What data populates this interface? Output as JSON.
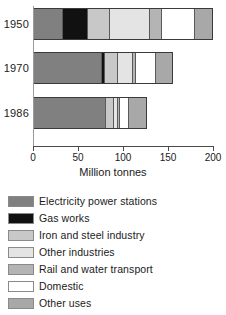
{
  "chart_data": {
    "type": "bar",
    "orientation": "horizontal",
    "stacked": true,
    "title": "",
    "xlabel": "Million tonnes",
    "ylabel": "",
    "xlim": [
      0,
      200
    ],
    "xticks": [
      0,
      50,
      100,
      150,
      200
    ],
    "xtick_labels": [
      "0",
      "50",
      "100",
      "150",
      "200"
    ],
    "grid": false,
    "legend_position": "below",
    "categories": [
      "1950",
      "1970",
      "1986"
    ],
    "series": [
      {
        "name": "Electricity power stations",
        "color": "#808080",
        "values": [
          33,
          77,
          82
        ]
      },
      {
        "name": "Gas works",
        "color": "#111111",
        "values": [
          28,
          3,
          0
        ]
      },
      {
        "name": "Iron and steel industry",
        "color": "#c8c8c8",
        "values": [
          24,
          15,
          9
        ]
      },
      {
        "name": "Other industries",
        "color": "#e4e4e4",
        "values": [
          45,
          17,
          4
        ]
      },
      {
        "name": "Rail and water transport",
        "color": "#b4b4b4",
        "values": [
          14,
          3,
          2
        ]
      },
      {
        "name": "Domestic",
        "color": "#ffffff",
        "values": [
          37,
          23,
          10
        ]
      },
      {
        "name": "Other uses",
        "color": "#a8a8a8",
        "values": [
          19,
          17,
          20
        ]
      }
    ],
    "totals": [
      200,
      155,
      127
    ]
  },
  "axis": {
    "xlabel": "Million tonnes",
    "ticks": [
      "0",
      "50",
      "100",
      "150",
      "200"
    ],
    "years": [
      "1950",
      "1970",
      "1986"
    ]
  },
  "legend": {
    "items": [
      {
        "label": "Electricity power stations",
        "color": "#808080"
      },
      {
        "label": "Gas works",
        "color": "#111111"
      },
      {
        "label": "Iron and steel industry",
        "color": "#c8c8c8"
      },
      {
        "label": "Other industries",
        "color": "#e4e4e4"
      },
      {
        "label": "Rail and water transport",
        "color": "#b4b4b4"
      },
      {
        "label": "Domestic",
        "color": "#ffffff"
      },
      {
        "label": "Other uses",
        "color": "#a8a8a8"
      }
    ]
  }
}
